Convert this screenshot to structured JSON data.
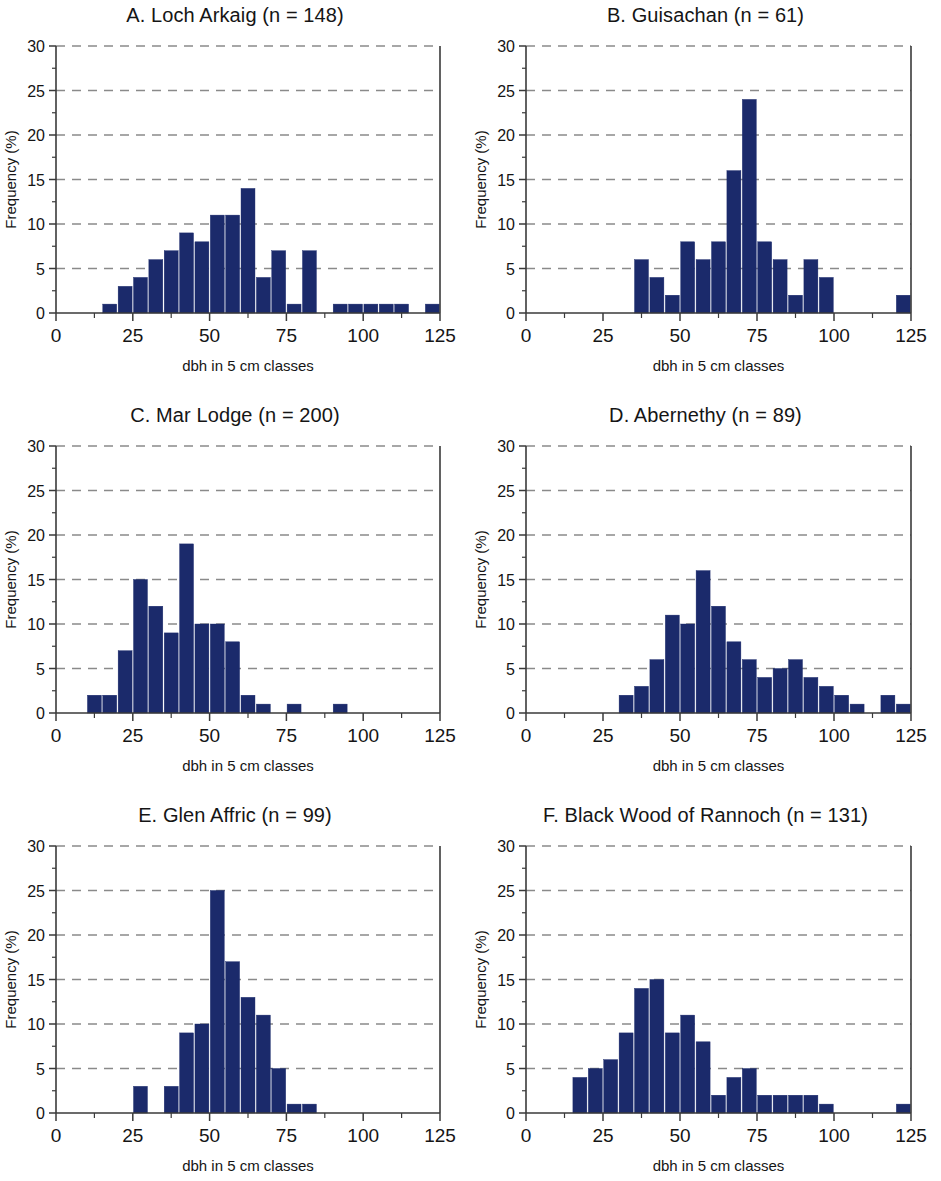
{
  "figure": {
    "background": "#ffffff",
    "bar_color": "#1b2a6b",
    "panel_count": 6
  },
  "axes": {
    "xlabel": "dbh in 5 cm classes",
    "ylabel": "Frequency (%)",
    "xticks": [
      0,
      25,
      50,
      75,
      100,
      125
    ],
    "yticks": [
      0,
      5,
      10,
      15,
      20,
      25,
      30
    ],
    "xlim": [
      0,
      125
    ],
    "ylim": [
      0,
      30
    ],
    "bin_width": 5,
    "grid": "horizontal-dashed"
  },
  "chart_data": [
    {
      "type": "bar",
      "panel": "A",
      "title": "A. Loch Arkaig (n = 148)",
      "site": "Loch Arkaig",
      "n": 148,
      "xlabel": "dbh in 5 cm classes",
      "ylabel": "Frequency (%)",
      "xlim": [
        0,
        125
      ],
      "ylim": [
        0,
        30
      ],
      "bin_width": 5,
      "bin_starts": [
        15,
        20,
        25,
        30,
        35,
        40,
        45,
        50,
        55,
        60,
        65,
        70,
        75,
        80,
        90,
        95,
        100,
        105,
        110,
        120
      ],
      "values": [
        1,
        3,
        4,
        6,
        7,
        9,
        8,
        11,
        11,
        14,
        4,
        7,
        1,
        7,
        1,
        1,
        1,
        1,
        1,
        1
      ]
    },
    {
      "type": "bar",
      "panel": "B",
      "title": "B. Guisachan (n = 61)",
      "site": "Guisachan",
      "n": 61,
      "xlabel": "dbh in 5 cm classes",
      "ylabel": "Frequency (%)",
      "xlim": [
        0,
        125
      ],
      "ylim": [
        0,
        30
      ],
      "bin_width": 5,
      "bin_starts": [
        35,
        40,
        45,
        50,
        55,
        60,
        65,
        70,
        75,
        80,
        85,
        90,
        95,
        120
      ],
      "values": [
        6,
        4,
        2,
        8,
        6,
        8,
        16,
        24,
        8,
        6,
        2,
        6,
        4,
        2
      ]
    },
    {
      "type": "bar",
      "panel": "C",
      "title": "C. Mar Lodge (n = 200)",
      "site": "Mar Lodge",
      "n": 200,
      "xlabel": "dbh in 5 cm classes",
      "ylabel": "Frequency (%)",
      "xlim": [
        0,
        125
      ],
      "ylim": [
        0,
        30
      ],
      "bin_width": 5,
      "bin_starts": [
        10,
        15,
        20,
        25,
        30,
        35,
        40,
        45,
        50,
        55,
        60,
        65,
        75,
        90
      ],
      "values": [
        2,
        2,
        7,
        15,
        12,
        9,
        19,
        10,
        10,
        8,
        2,
        1,
        1,
        1
      ]
    },
    {
      "type": "bar",
      "panel": "D",
      "title": "D. Abernethy (n = 89)",
      "site": "Abernethy",
      "n": 89,
      "xlabel": "dbh in 5 cm classes",
      "ylabel": "Frequency (%)",
      "xlim": [
        0,
        125
      ],
      "ylim": [
        0,
        30
      ],
      "bin_width": 5,
      "bin_starts": [
        30,
        35,
        40,
        45,
        50,
        55,
        60,
        65,
        70,
        75,
        80,
        85,
        90,
        95,
        100,
        105,
        115,
        120
      ],
      "values": [
        2,
        3,
        6,
        11,
        10,
        16,
        12,
        8,
        6,
        4,
        5,
        6,
        4,
        3,
        2,
        1,
        2,
        1
      ]
    },
    {
      "type": "bar",
      "panel": "E",
      "title": "E. Glen Affric (n = 99)",
      "site": "Glen Affric",
      "n": 99,
      "xlabel": "dbh in 5 cm classes",
      "ylabel": "Frequency (%)",
      "xlim": [
        0,
        125
      ],
      "ylim": [
        0,
        30
      ],
      "bin_width": 5,
      "bin_starts": [
        25,
        35,
        40,
        45,
        50,
        55,
        60,
        65,
        70,
        75,
        80
      ],
      "values": [
        3,
        3,
        9,
        10,
        25,
        17,
        13,
        11,
        5,
        1,
        1
      ]
    },
    {
      "type": "bar",
      "panel": "F",
      "title": "F. Black Wood of Rannoch (n = 131)",
      "site": "Black Wood of Rannoch",
      "n": 131,
      "xlabel": "dbh in 5 cm classes",
      "ylabel": "Frequency (%)",
      "xlim": [
        0,
        125
      ],
      "ylim": [
        0,
        30
      ],
      "bin_width": 5,
      "bin_starts": [
        15,
        20,
        25,
        30,
        35,
        40,
        45,
        50,
        55,
        60,
        65,
        70,
        75,
        80,
        85,
        90,
        95,
        120
      ],
      "values": [
        4,
        5,
        6,
        9,
        14,
        15,
        9,
        11,
        8,
        2,
        4,
        5,
        2,
        2,
        2,
        2,
        1,
        1
      ]
    }
  ]
}
